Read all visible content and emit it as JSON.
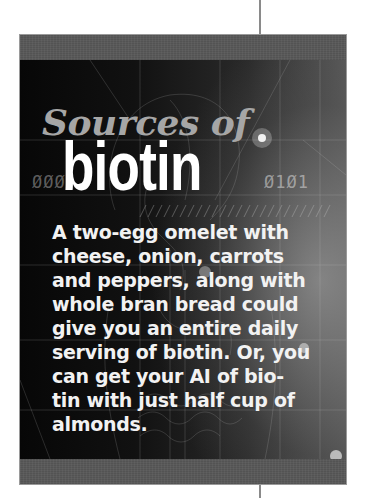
{
  "sidebar": {
    "title_line1": "Sources of",
    "title_line2": "biotin",
    "decor_binary_left": "ØØØ",
    "decor_binary_right": "Ø1Ø1",
    "body_lines": [
      "A two-egg omelet with",
      "cheese, onion, carrots",
      "and peppers, along with",
      "whole bran bread could",
      "give you an entire daily",
      "serving of biotin. Or, you",
      "can get your AI of bio-",
      "tin with just half cup of",
      "almonds."
    ],
    "colors": {
      "panel_background": "#0d0d0d",
      "band_gray": "#5a5a5a",
      "title_line1": "#a6a6a6",
      "title_line2": "#ffffff",
      "body_text": "#f2f2f2",
      "rule": "#8a8a8a"
    }
  }
}
